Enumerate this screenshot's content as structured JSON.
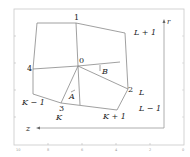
{
  "diagram": {
    "vertex_labels": {
      "v0": "0",
      "v1": "1",
      "v2": "2",
      "v3": "3",
      "v4": "4"
    },
    "region_labels": {
      "L_plus_1": "L + 1",
      "L": "L",
      "L_minus_1": "L − 1",
      "K_minus_1": "K − 1",
      "K": "K",
      "K_plus_1": "K + 1"
    },
    "vector_labels": {
      "A": "A",
      "B": "B"
    },
    "axis_labels": {
      "r": "r",
      "z": "z"
    },
    "axes_ticks": {
      "x": [
        "10",
        "8",
        "6",
        "4",
        "2",
        "0"
      ],
      "y": [
        "10",
        "8",
        "6",
        "4",
        "2",
        "0"
      ]
    },
    "colors": {
      "lines": "#888888",
      "frame": "#bbbbbb",
      "text": "#222222"
    }
  }
}
